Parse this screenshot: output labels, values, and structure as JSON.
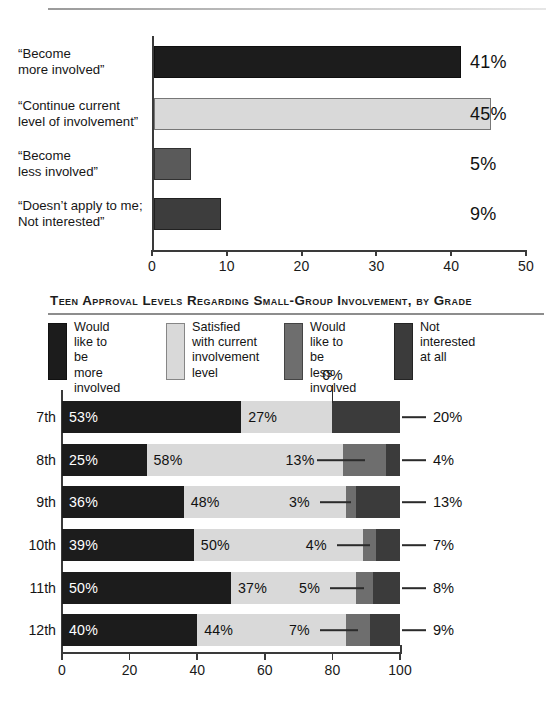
{
  "chart_data": [
    {
      "type": "bar",
      "title": "",
      "orientation": "horizontal",
      "categories": [
        "“Become\nmore involved”",
        "“Continue current\nlevel of involvement”",
        "“Become\nless involved”",
        "“Doesn’t apply to me;\nNot interested”"
      ],
      "category_lines": [
        [
          "“Become",
          "more involved”"
        ],
        [
          "“Continue current",
          "level of involvement”"
        ],
        [
          "“Become",
          "less involved”"
        ],
        [
          "“Doesn’t apply to me;",
          "Not interested”"
        ]
      ],
      "values": [
        41,
        45,
        5,
        9
      ],
      "value_labels": [
        "41%",
        "45%",
        "5%",
        "9%"
      ],
      "colors": [
        "#1c1c1c",
        "#d9d9d9",
        "#5a5a5a",
        "#3d3d3d"
      ],
      "xlabel": "",
      "ylabel": "",
      "xlim": [
        0,
        50
      ],
      "xticks": [
        0,
        10,
        20,
        30,
        40,
        50
      ],
      "xtick_labels": [
        "0",
        "10",
        "20",
        "30",
        "40",
        "50"
      ],
      "grid": false
    },
    {
      "type": "bar",
      "subtype": "stacked-horizontal-100",
      "title": "Teen Approval Levels Regarding Small-Group Involvement, by Grade",
      "categories": [
        "7th",
        "8th",
        "9th",
        "10th",
        "11th",
        "12th"
      ],
      "series": [
        {
          "name": "Would like to be more involved",
          "color": "#1c1c1c",
          "values": [
            53,
            25,
            36,
            39,
            50,
            40
          ]
        },
        {
          "name": "Satisfied with current involvement level",
          "color": "#d9d9d9",
          "values": [
            27,
            58,
            48,
            50,
            37,
            44
          ]
        },
        {
          "name": "Would like to be less involved",
          "color": "#6e6e6e",
          "values": [
            0,
            13,
            3,
            4,
            5,
            7
          ]
        },
        {
          "name": "Not interested at all",
          "color": "#3b3b3b",
          "values": [
            20,
            4,
            13,
            7,
            8,
            9
          ]
        }
      ],
      "legend_lines": [
        [
          "Would",
          "like to be",
          "more",
          "involved"
        ],
        [
          "Satisfied",
          "with current",
          "involvement",
          "level"
        ],
        [
          "Would",
          "like to be",
          "less",
          "involved"
        ],
        [
          "Not",
          "interested",
          "at all"
        ]
      ],
      "data_labels": {
        "7th": {
          "more": "53%",
          "satisfied": "27%",
          "less": "0%",
          "not": "20%"
        },
        "8th": {
          "more": "25%",
          "satisfied": "58%",
          "less": "13%",
          "not": "4%"
        },
        "9th": {
          "more": "36%",
          "satisfied": "48%",
          "less": "3%",
          "not": "13%"
        },
        "10th": {
          "more": "39%",
          "satisfied": "50%",
          "less": "4%",
          "not": "7%"
        },
        "11th": {
          "more": "50%",
          "satisfied": "37%",
          "less": "5%",
          "not": "8%"
        },
        "12th": {
          "more": "40%",
          "satisfied": "44%",
          "less": "7%",
          "not": "9%"
        }
      },
      "xlabel": "",
      "ylabel": "",
      "xlim": [
        0,
        100
      ],
      "xticks": [
        0,
        20,
        40,
        60,
        80,
        100
      ],
      "xtick_labels": [
        "0",
        "20",
        "40",
        "60",
        "80",
        "100"
      ],
      "grid": false,
      "legend_position": "top-left"
    }
  ]
}
